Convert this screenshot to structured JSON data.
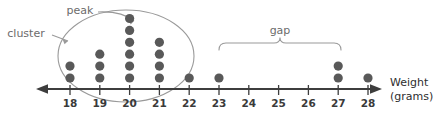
{
  "chart_data": {
    "type": "dotplot",
    "title": "",
    "xlabel_line1": "Weight",
    "xlabel_line2": "(grams)",
    "ylabel": "",
    "categories": [
      18,
      19,
      20,
      21,
      22,
      23,
      24,
      25,
      26,
      27,
      28
    ],
    "tick_labels": [
      "18",
      "19",
      "20",
      "21",
      "22",
      "23",
      "24",
      "25",
      "26",
      "27",
      "28"
    ],
    "values": [
      2,
      3,
      6,
      4,
      1,
      1,
      0,
      0,
      0,
      2,
      1
    ],
    "xlim": [
      18,
      28
    ],
    "grid": false,
    "legend": "none",
    "dot_color": "#595959",
    "axis_color": "#3d3d3d",
    "annotation_color": "#8a8a8a",
    "annotations": [
      {
        "name": "peak",
        "label": "peak",
        "points_to_category": 20,
        "points_to_stack_index": 6,
        "description": "arrow pointing to the tallest stack of dots at 20 grams"
      },
      {
        "name": "cluster",
        "label": "cluster",
        "points_to_category": 18,
        "description": "arrow pointing to the oval encircling the dots from 18 to 22 grams"
      },
      {
        "name": "gap",
        "label": "gap",
        "span_from_category": 23,
        "span_to_category": 27,
        "description": "curly bracket spanning the empty region between 23 and 27 grams"
      }
    ],
    "cluster_ellipse": {
      "from_category": 18,
      "to_category": 22,
      "label": "cluster"
    }
  }
}
